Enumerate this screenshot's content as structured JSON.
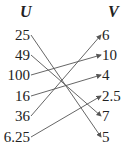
{
  "domain_header": {
    "left": "U",
    "right": "V"
  },
  "left_items": [
    "25",
    "49",
    "100",
    "16",
    "36",
    "6.25"
  ],
  "right_items": [
    "6",
    "10",
    "4",
    "2.5",
    "7",
    "5"
  ],
  "mappings": [
    {
      "from": "25",
      "to": "5"
    },
    {
      "from": "49",
      "to": "7"
    },
    {
      "from": "100",
      "to": "10"
    },
    {
      "from": "16",
      "to": "4"
    },
    {
      "from": "36",
      "to": "6"
    },
    {
      "from": "6.25",
      "to": "2.5"
    }
  ],
  "colors": {
    "arrow": "#555555",
    "text": "#222222"
  }
}
